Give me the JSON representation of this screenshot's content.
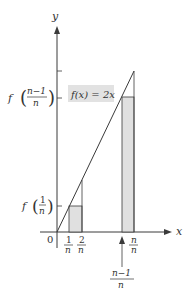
{
  "figure": {
    "function_label": "f(x) = 2x",
    "axes": {
      "x_label": "x",
      "y_label": "y",
      "origin_label": "0"
    },
    "x_ticks": [
      {
        "num": "1",
        "den": "n"
      },
      {
        "num": "2",
        "den": "n"
      },
      {
        "num": "n",
        "den": "n"
      }
    ],
    "y_ticks": [
      {
        "prefix": "f",
        "num": "1",
        "den": "n"
      },
      {
        "prefix": "f",
        "num": "n−1",
        "den": "n"
      }
    ],
    "pointer_label": {
      "num": "n−1",
      "den": "n"
    },
    "colors": {
      "stroke": "#3a3a3a",
      "fill": "#e0e0e0",
      "label_bg": "#e2e2e2"
    }
  }
}
